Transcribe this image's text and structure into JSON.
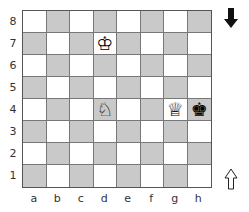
{
  "board": {
    "files": [
      "a",
      "b",
      "c",
      "d",
      "e",
      "f",
      "g",
      "h"
    ],
    "ranks": [
      "8",
      "7",
      "6",
      "5",
      "4",
      "3",
      "2",
      "1"
    ],
    "light_color": "#ffffff",
    "dark_color": "#c9c9c9",
    "pieces": [
      {
        "square": "d7",
        "piece": "king",
        "color": "white",
        "glyph": "♔"
      },
      {
        "square": "d4",
        "piece": "knight",
        "color": "white",
        "glyph": "♘"
      },
      {
        "square": "g4",
        "piece": "queen",
        "color": "white",
        "glyph": "♕"
      },
      {
        "square": "h4",
        "piece": "king",
        "color": "black",
        "glyph": "♚"
      }
    ]
  },
  "indicators": {
    "top_arrow": {
      "icon": "black-down-arrow-icon",
      "meaning": "black side"
    },
    "bottom_arrow": {
      "icon": "white-up-arrow-icon",
      "meaning": "white side"
    }
  }
}
